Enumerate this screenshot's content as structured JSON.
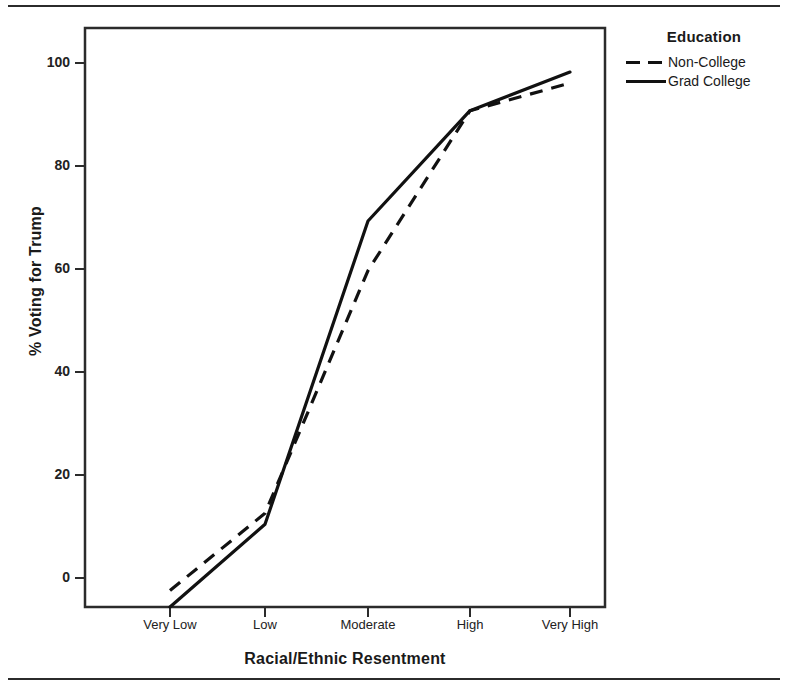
{
  "chart_data": {
    "type": "line",
    "title": "",
    "xlabel": "Racial/Ethnic Resentment",
    "ylabel": "% Voting for Trump",
    "categories": [
      "Very Low",
      "Low",
      "Moderate",
      "High",
      "Very High"
    ],
    "ylim": [
      0,
      105
    ],
    "yticks": [
      0,
      20,
      40,
      60,
      80,
      100
    ],
    "ytick_labels": [
      "0",
      "20",
      "40",
      "60",
      "80",
      "100"
    ],
    "grid": false,
    "legend": {
      "title": "Education",
      "position": "right",
      "entries": [
        {
          "name": "Non-College",
          "style": "dashed"
        },
        {
          "name": "Grad College",
          "style": "solid"
        }
      ]
    },
    "series": [
      {
        "name": "Non-College",
        "style": "dashed",
        "color": "#111111",
        "values": [
          3,
          17,
          61,
          90,
          95
        ]
      },
      {
        "name": "Grad College",
        "style": "solid",
        "color": "#111111",
        "values": [
          0,
          15,
          70,
          90,
          97
        ]
      }
    ]
  },
  "axes": {
    "y_title": "% Voting for Trump",
    "x_title": "Racial/Ethnic Resentment",
    "y_tick_labels": [
      "100",
      "80",
      "60",
      "40",
      "20",
      "0"
    ],
    "x_tick_labels": [
      "Very Low",
      "Low",
      "Moderate",
      "High",
      "Very High"
    ]
  },
  "legend": {
    "title": "Education",
    "item_0_label": "Non-College",
    "item_1_label": "Grad College"
  },
  "colors": {
    "line": "#111111",
    "frame": "#2b2b2b",
    "background": "#ffffff"
  }
}
